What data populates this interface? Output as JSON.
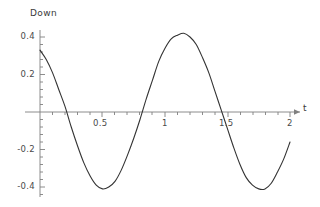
{
  "chart_data": {
    "type": "line",
    "title": "",
    "subtitle": "",
    "xlabel": "t",
    "ylabel": "Down",
    "xlim": [
      0,
      2
    ],
    "ylim": [
      -0.45,
      0.45
    ],
    "grid": false,
    "legend": null,
    "xticks": [
      {
        "value": 0.5,
        "label": "0.5"
      },
      {
        "value": 1,
        "label": "1"
      },
      {
        "value": 1.5,
        "label": "1.5"
      },
      {
        "value": 2,
        "label": "2"
      }
    ],
    "yticks": [
      {
        "value": 0.4,
        "label": "0.4"
      },
      {
        "value": 0.2,
        "label": "0.2"
      },
      {
        "value": -0.2,
        "label": "-0.2"
      },
      {
        "value": -0.4,
        "label": "-0.4"
      }
    ],
    "minor_tick_count_x": 4,
    "minor_tick_count_y": 4,
    "line_color": "#333333",
    "axis_color": "#808080",
    "series": [
      {
        "name": "Down",
        "x": [
          0.0,
          0.05,
          0.1,
          0.15,
          0.2,
          0.25,
          0.3,
          0.35,
          0.4,
          0.45,
          0.5,
          0.55,
          0.6,
          0.65,
          0.7,
          0.75,
          0.8,
          0.85,
          0.9,
          0.95,
          1.0,
          1.05,
          1.1,
          1.15,
          1.2,
          1.25,
          1.3,
          1.35,
          1.4,
          1.45,
          1.5,
          1.55,
          1.6,
          1.65,
          1.7,
          1.75,
          1.8,
          1.85,
          1.9,
          1.95,
          2.0
        ],
        "y": [
          0.33,
          0.28,
          0.21,
          0.12,
          0.03,
          -0.08,
          -0.18,
          -0.27,
          -0.34,
          -0.39,
          -0.41,
          -0.4,
          -0.37,
          -0.31,
          -0.23,
          -0.14,
          -0.04,
          0.07,
          0.17,
          0.27,
          0.34,
          0.39,
          0.41,
          0.42,
          0.4,
          0.36,
          0.29,
          0.21,
          0.11,
          0.01,
          -0.09,
          -0.19,
          -0.28,
          -0.35,
          -0.39,
          -0.41,
          -0.41,
          -0.38,
          -0.32,
          -0.25,
          -0.16
        ]
      }
    ],
    "annotations": {
      "maximum": {
        "x": 1.15,
        "y": 0.42
      },
      "minimum_first": {
        "x": 0.5,
        "y": -0.41
      },
      "minimum_second": {
        "x": 1.8,
        "y": -0.41
      },
      "zero_crossings": [
        0.22,
        0.82,
        1.45
      ],
      "start_value": 0.33,
      "end_value": -0.16
    }
  }
}
